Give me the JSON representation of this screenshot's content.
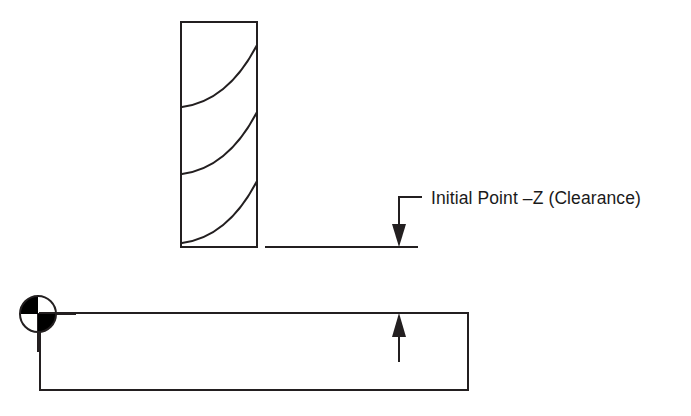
{
  "diagram": {
    "background_color": "#ffffff",
    "line_color": "#231f20",
    "fill_color": "#000000",
    "annotations": [
      {
        "id": "initial-point",
        "text": "Initial Point –Z (Clearance)",
        "leader": "elbow-down-arrow",
        "points_to": "clearance-plane-line"
      }
    ],
    "components": {
      "drill_tool": {
        "label": "drill-bit",
        "flute_count": 3,
        "body": {
          "x": 181,
          "y": 22,
          "width": 76,
          "height": 225
        }
      },
      "clearance_line": {
        "label": "clearance-plane",
        "x1": 265,
        "y1": 247,
        "x2": 418,
        "y2": 247
      },
      "workpiece": {
        "label": "workpiece",
        "x": 40,
        "y": 313,
        "width": 428,
        "height": 77
      },
      "origin_symbol": {
        "label": "program-zero-datum",
        "cx": 38,
        "cy": 314,
        "r": 18,
        "filled_quadrants": "top-left,bottom-right"
      },
      "feed_arrow": {
        "label": "feed-direction-up-arrow",
        "x": 399,
        "y_tail": 362,
        "y_head": 314
      },
      "clearance_arrow": {
        "label": "clearance-down-arrow",
        "x": 399,
        "y_tail": 197,
        "y_head": 247
      }
    }
  }
}
